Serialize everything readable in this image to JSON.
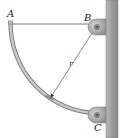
{
  "figure": {
    "type": "mechanics-diagram",
    "labels": {
      "point_a": "A",
      "point_b": "B",
      "point_c": "C",
      "radius": "r"
    },
    "colors": {
      "wall": "#9a9a9a",
      "rod": "#b8b8b8",
      "rod_outline": "#6e6e6e",
      "cable": "#555555",
      "bracket": "#a6a6a6",
      "text": "#222222"
    }
  }
}
